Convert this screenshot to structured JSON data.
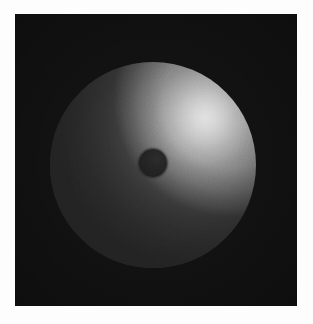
{
  "figure": {
    "kind": "rendered-3d-sphere",
    "caption": "",
    "canvas": {
      "width_px": 313,
      "height_px": 324,
      "page_background_hex": "#fdfdfd"
    },
    "panel": {
      "name": "render-panel",
      "x_px": 15,
      "y_px": 14,
      "width_px": 282,
      "height_px": 292,
      "background_hex": "#0d0d0d",
      "description": "near-black rendering viewport background"
    },
    "sphere": {
      "name": "shaded-sphere",
      "center_x_px": 153,
      "center_y_px": 165,
      "radius_px": 103,
      "shading_model": "diffuse-plus-specular",
      "base_color_hex": "#8a8a8a",
      "brightest_hex": "#cfcfcf",
      "darkest_hex": "#343434",
      "light_direction": "upper-right"
    },
    "specular": {
      "name": "specular-highlight",
      "center_x_px": 205,
      "center_y_px": 118,
      "radius_px": 52,
      "peak_color_hex": "#e6e6e6"
    },
    "center_hole": {
      "name": "center-hole",
      "center_x_px": 153,
      "center_y_px": 163,
      "radius_px": 14,
      "fill_hex": "#1b1b1b",
      "description": "small dark circular aperture at the sphere centre"
    },
    "texture": {
      "name": "film-grain",
      "type": "scan-noise",
      "opacity": 0.16
    }
  },
  "chart_data": {
    "type": "heatmap",
    "title": "",
    "xlabel": "",
    "ylabel": "",
    "grid": false,
    "legend": "none",
    "xlim": [
      15,
      297
    ],
    "ylim": [
      14,
      306
    ],
    "intensity_range_hex": [
      "#0d0d0d",
      "#cfcfcf"
    ],
    "samples": [
      {
        "label": "background (top-left corner)",
        "x": 30,
        "y": 30,
        "gray": 13,
        "hex": "#0d0d0d"
      },
      {
        "label": "background (top-right corner)",
        "x": 285,
        "y": 30,
        "gray": 14,
        "hex": "#0e0e0e"
      },
      {
        "label": "background (bottom-left corner)",
        "x": 30,
        "y": 292,
        "gray": 13,
        "hex": "#0d0d0d"
      },
      {
        "label": "background (bottom-right corner)",
        "x": 285,
        "y": 292,
        "gray": 15,
        "hex": "#0f0f0f"
      },
      {
        "label": "sphere upper-right highlight peak",
        "x": 205,
        "y": 118,
        "gray": 207,
        "hex": "#cfcfcf"
      },
      {
        "label": "sphere upper-right mid",
        "x": 195,
        "y": 140,
        "gray": 170,
        "hex": "#aaaaaa"
      },
      {
        "label": "sphere top-centre",
        "x": 153,
        "y": 80,
        "gray": 104,
        "hex": "#686868"
      },
      {
        "label": "sphere right limb",
        "x": 245,
        "y": 165,
        "gray": 96,
        "hex": "#606060"
      },
      {
        "label": "sphere centre-left of hole",
        "x": 120,
        "y": 163,
        "gray": 74,
        "hex": "#4a4a4a"
      },
      {
        "label": "sphere left limb",
        "x": 62,
        "y": 165,
        "gray": 58,
        "hex": "#3a3a3a"
      },
      {
        "label": "sphere lower-left",
        "x": 95,
        "y": 225,
        "gray": 55,
        "hex": "#373737"
      },
      {
        "label": "sphere bottom-centre",
        "x": 153,
        "y": 250,
        "gray": 56,
        "hex": "#383838"
      },
      {
        "label": "sphere lower-right",
        "x": 215,
        "y": 225,
        "gray": 64,
        "hex": "#404040"
      },
      {
        "label": "centre hole interior",
        "x": 153,
        "y": 163,
        "gray": 27,
        "hex": "#1b1b1b"
      }
    ],
    "geometry": [
      {
        "shape": "rect",
        "name": "render-panel",
        "x": 15,
        "y": 14,
        "width": 282,
        "height": 292
      },
      {
        "shape": "circle",
        "name": "sphere",
        "cx": 153,
        "cy": 165,
        "r": 103
      },
      {
        "shape": "circle",
        "name": "center-hole",
        "cx": 153,
        "cy": 163,
        "r": 14
      }
    ]
  }
}
